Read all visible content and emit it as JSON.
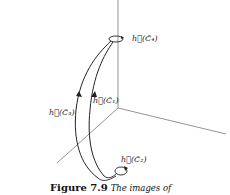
{
  "figure": {
    "labels": {
      "c4": "h⃗(C̃₄)",
      "c3": "h⃗(C̃₃)",
      "c1": "h⃗(C̃₁)",
      "c2": "h⃗(C̃₂)"
    },
    "caption": {
      "number": "Figure 7.9",
      "text": "The images of"
    },
    "colors": {
      "axis": "#777777",
      "curve": "#222222"
    }
  }
}
